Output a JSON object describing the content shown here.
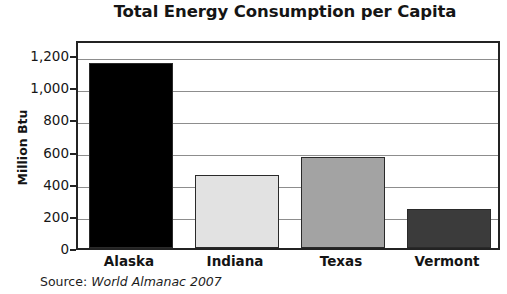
{
  "chart_data": {
    "type": "bar",
    "title": "Total Energy Consumption per Capita",
    "xlabel": "",
    "ylabel": "Million Btu",
    "categories": [
      "Alaska",
      "Indiana",
      "Texas",
      "Vermont"
    ],
    "values": [
      1150,
      455,
      565,
      245
    ],
    "series": [
      {
        "name": "Total Energy Consumption per Capita",
        "values": [
          1150,
          455,
          565,
          245
        ]
      }
    ],
    "ylim": [
      0,
      1300
    ],
    "y_ticks": [
      0,
      200,
      400,
      600,
      800,
      1000,
      1200
    ],
    "y_tick_labels": [
      "0",
      "200",
      "400",
      "600",
      "800",
      "1,000",
      "1,200"
    ],
    "grid": true,
    "grid_axis": "y",
    "legend": false,
    "legend_position": "none",
    "bar_colors": [
      "#000000",
      "#e2e2e2",
      "#a3a3a3",
      "#3b3b3b"
    ],
    "bar_border_color": "#2a2a2a",
    "axis_color": "#232323",
    "gridline_color": "#8d8d8d",
    "plot_background": "#ffffff",
    "annotations": []
  },
  "source": {
    "label": "Source:",
    "reference": "World Almanac 2007"
  }
}
